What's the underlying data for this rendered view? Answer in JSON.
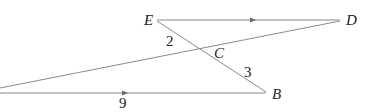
{
  "diagram": {
    "points": {
      "E": {
        "label": "E",
        "x": 155,
        "y": 20
      },
      "D": {
        "label": "D",
        "x": 342,
        "y": 20
      },
      "C": {
        "label": "C",
        "x": 200,
        "y": 47
      },
      "B": {
        "label": "B",
        "x": 268,
        "y": 94
      },
      "A": {
        "label": "",
        "x": 0,
        "y": 93
      }
    },
    "segments": [
      {
        "from": "E",
        "to": "D",
        "parallel_arrow": true
      },
      {
        "from": "A",
        "to": "B",
        "parallel_arrow": true
      },
      {
        "from": "E",
        "to": "B",
        "parallel_arrow": false
      },
      {
        "from": "A",
        "to": "D",
        "parallel_arrow": false
      }
    ],
    "measurements": {
      "EC": "2",
      "CB": "3",
      "AB": "9"
    },
    "colors": {
      "line": "#8a8a8a",
      "text": "#222222"
    }
  }
}
